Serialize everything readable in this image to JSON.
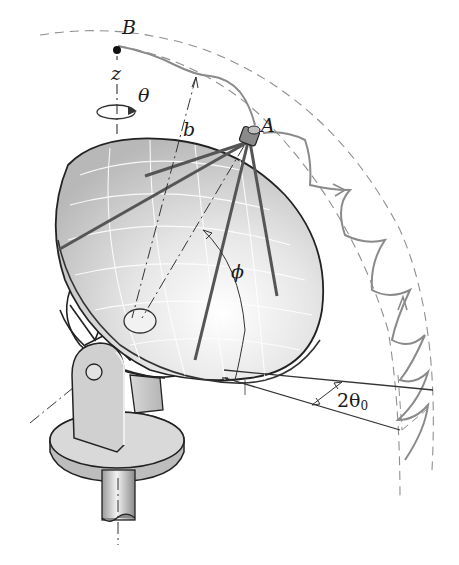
{
  "figure": {
    "labels": {
      "point_b": "B",
      "point_a": "A",
      "axis_z": "z",
      "angle_theta": "θ",
      "radius_b": "b",
      "angle_phi": "ϕ",
      "angle_2theta0_main": "2θ",
      "angle_2theta0_sub": "0"
    },
    "colors": {
      "ink": "#1a1a1a",
      "dish_fill": "#c9c9c9",
      "dish_light": "#efefef",
      "path_gray": "#8a8a8a",
      "dashed_gray": "#8f8f8f",
      "base_fill": "#d2d2d2"
    }
  }
}
